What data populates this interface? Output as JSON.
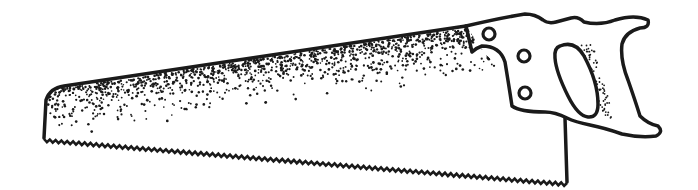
{
  "image": {
    "subject": "hand-saw",
    "style": "black-ink stippled line art on white",
    "colors": {
      "ink": "#1a1a1a",
      "background": "#ffffff"
    },
    "parts": {
      "blade": {
        "name": "blade",
        "texture": "stippled",
        "teeth": "serrated bottom edge"
      },
      "handle": {
        "name": "handle",
        "rivets": 3,
        "grip_hole": 1
      }
    }
  }
}
